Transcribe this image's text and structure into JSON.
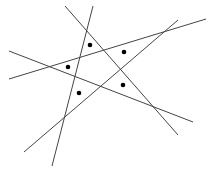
{
  "diagram": {
    "line_color": "#444444",
    "dot_color": "#000000",
    "background": "#ffffff",
    "lines": [
      {
        "x1": 65,
        "y1": 6,
        "x2": 178,
        "y2": 135
      },
      {
        "x1": 93,
        "y1": 6,
        "x2": 52,
        "y2": 166
      },
      {
        "x1": 9,
        "y1": 79,
        "x2": 206,
        "y2": 19
      },
      {
        "x1": 9,
        "y1": 51,
        "x2": 193,
        "y2": 122
      },
      {
        "x1": 178,
        "y1": 20,
        "x2": 24,
        "y2": 152
      }
    ],
    "dots": [
      {
        "cx": 90,
        "cy": 45
      },
      {
        "cx": 124,
        "cy": 52
      },
      {
        "cx": 68,
        "cy": 67
      },
      {
        "cx": 79,
        "cy": 93
      },
      {
        "cx": 123,
        "cy": 85
      }
    ]
  }
}
